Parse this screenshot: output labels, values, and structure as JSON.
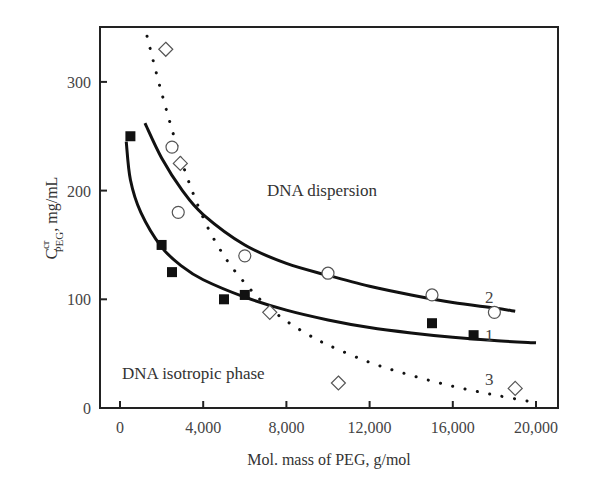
{
  "chart_data": {
    "type": "scatter",
    "title": "",
    "xlabel": "Mol. mass of PEG, g/mol",
    "ylabel": {
      "main": "C",
      "superscript": "cr",
      "subscript": "PEG",
      "units": ", mg/mL"
    },
    "xlim": [
      -1000,
      21000
    ],
    "ylim": [
      0,
      350
    ],
    "x_ticks": [
      0,
      4000,
      8000,
      12000,
      16000,
      20000
    ],
    "x_tick_labels": [
      "0",
      "4,000",
      "8,000",
      "12,000",
      "16,000",
      "20,000"
    ],
    "y_ticks": [
      0,
      100,
      200,
      300
    ],
    "y_tick_labels": [
      "0",
      "100",
      "200",
      "300"
    ],
    "grid": false,
    "annotations": [
      {
        "text": "DNA dispersion",
        "x": 7500,
        "y": 200
      },
      {
        "text": "DNA isotropic phase",
        "x": 4000,
        "y": 33
      }
    ],
    "series": [
      {
        "name": "1",
        "marker": "filled-square",
        "points": [
          [
            500,
            250
          ],
          [
            2000,
            150
          ],
          [
            2500,
            125
          ],
          [
            5000,
            100
          ],
          [
            6000,
            104
          ],
          [
            15000,
            78
          ],
          [
            17000,
            67
          ]
        ],
        "fit_curve": [
          [
            300,
            245
          ],
          [
            500,
            210
          ],
          [
            1000,
            180
          ],
          [
            2000,
            148
          ],
          [
            3000,
            130
          ],
          [
            4000,
            118
          ],
          [
            6000,
            102
          ],
          [
            8000,
            90
          ],
          [
            10000,
            81
          ],
          [
            12000,
            74
          ],
          [
            14000,
            69
          ],
          [
            16000,
            65
          ],
          [
            18000,
            62
          ],
          [
            20000,
            60
          ]
        ]
      },
      {
        "name": "2",
        "marker": "open-circle",
        "points": [
          [
            2500,
            240
          ],
          [
            2800,
            180
          ],
          [
            6000,
            140
          ],
          [
            10000,
            124
          ],
          [
            15000,
            104
          ],
          [
            18000,
            88
          ]
        ],
        "fit_curve": [
          [
            1200,
            262
          ],
          [
            2000,
            230
          ],
          [
            3000,
            200
          ],
          [
            4000,
            178
          ],
          [
            6000,
            150
          ],
          [
            8000,
            133
          ],
          [
            10000,
            122
          ],
          [
            12000,
            112
          ],
          [
            14000,
            104
          ],
          [
            16000,
            97
          ],
          [
            18000,
            92
          ],
          [
            19000,
            89
          ]
        ]
      },
      {
        "name": "3",
        "marker": "open-diamond",
        "points": [
          [
            2200,
            330
          ],
          [
            2900,
            225
          ],
          [
            7200,
            88
          ],
          [
            10500,
            23
          ],
          [
            19000,
            18
          ]
        ],
        "fit_curve": [
          [
            1300,
            342
          ],
          [
            2000,
            290
          ],
          [
            3000,
            225
          ],
          [
            4000,
            175
          ],
          [
            5000,
            140
          ],
          [
            6000,
            115
          ],
          [
            7000,
            95
          ],
          [
            8000,
            80
          ],
          [
            9000,
            68
          ],
          [
            10000,
            58
          ],
          [
            12000,
            42
          ],
          [
            14000,
            30
          ],
          [
            16000,
            20
          ],
          [
            18000,
            12
          ],
          [
            20000,
            5
          ]
        ]
      }
    ],
    "curve_labels": [
      {
        "text": "2",
        "x": 18300,
        "y": 100
      },
      {
        "text": "1",
        "x": 18300,
        "y": 67
      },
      {
        "text": "3",
        "x": 18300,
        "y": 26
      }
    ]
  },
  "labels": {
    "x_axis_title": "Mol. mass of PEG, g/mol",
    "y_axis_main": "C",
    "y_axis_sup": "cr",
    "y_axis_sub": "PEG",
    "y_axis_units": ", mg/mL",
    "region_upper": "DNA dispersion",
    "region_lower": "DNA isotropic phase",
    "curve_1": "1",
    "curve_2": "2",
    "curve_3": "3",
    "x_ticks": [
      "0",
      "4,000",
      "8,000",
      "12,000",
      "16,000",
      "20,000"
    ],
    "y_ticks": [
      "0",
      "100",
      "200",
      "300"
    ]
  }
}
